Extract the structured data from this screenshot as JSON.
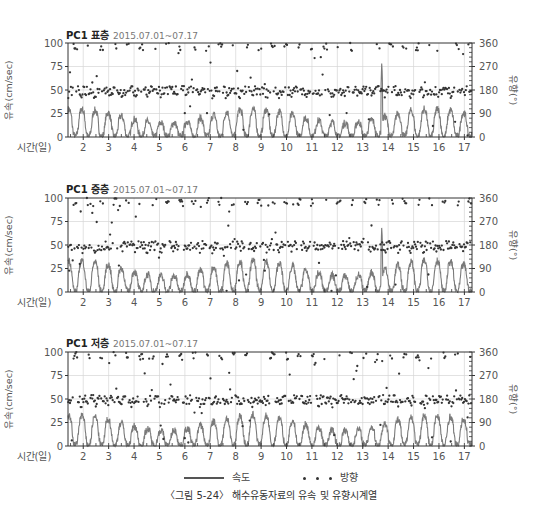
{
  "chart_data": [
    {
      "type": "line",
      "title": "PC1 표층",
      "subtitle": "2015.07.01~07.17",
      "xlabel": "시간(일)",
      "ylabel": "유속(cm/sec)",
      "y2label": "유향(°)",
      "x_ticks": [
        2,
        3,
        4,
        5,
        6,
        7,
        8,
        9,
        10,
        11,
        12,
        13,
        14,
        15,
        16,
        17
      ],
      "xlim": [
        1.4,
        17.3
      ],
      "ylim": [
        0,
        100
      ],
      "y_ticks": [
        0,
        25,
        50,
        75,
        100
      ],
      "y2lim": [
        0,
        360
      ],
      "y2_ticks": [
        0,
        90,
        180,
        270,
        360
      ],
      "grid": true,
      "series": [
        {
          "name": "속도",
          "kind": "line",
          "axis": "left",
          "color": "#7a7a7a",
          "pattern": "semidiurnal tidal speed, 0–35 cm/sec, peak spike ~80 near day 13.8",
          "amplitude": 30,
          "spike": {
            "x": 13.75,
            "y": 80
          }
        },
        {
          "name": "방향",
          "kind": "scatter",
          "axis": "right",
          "color": "#333333",
          "pattern": "direction clusters ~160–190°, scattered points near 340–360° and 0°"
        }
      ]
    },
    {
      "type": "line",
      "title": "PC1 중층",
      "subtitle": "2015.07.01~07.17",
      "xlabel": "시간(일)",
      "ylabel": "유속(cm/sec)",
      "y2label": "유향(°)",
      "x_ticks": [
        2,
        3,
        4,
        5,
        6,
        7,
        8,
        9,
        10,
        11,
        12,
        13,
        14,
        15,
        16,
        17
      ],
      "xlim": [
        1.4,
        17.3
      ],
      "ylim": [
        0,
        100
      ],
      "y_ticks": [
        0,
        25,
        50,
        75,
        100
      ],
      "y2lim": [
        0,
        360
      ],
      "y2_ticks": [
        0,
        90,
        180,
        270,
        360
      ],
      "grid": true,
      "series": [
        {
          "name": "속도",
          "kind": "line",
          "axis": "left",
          "color": "#7a7a7a",
          "pattern": "semidiurnal tidal speed, 0–40 cm/sec, spike ~70 near day 13.8",
          "amplitude": 34,
          "spike": {
            "x": 13.75,
            "y": 70
          }
        },
        {
          "name": "방향",
          "kind": "scatter",
          "axis": "right",
          "color": "#333333",
          "pattern": "direction clusters ~160–190°, scattered points near 340–360° and 0°"
        }
      ]
    },
    {
      "type": "line",
      "title": "PC1 저층",
      "subtitle": "2015.07.01~07.17",
      "xlabel": "시간(일)",
      "ylabel": "유속(cm/sec)",
      "y2label": "유향(°)",
      "x_ticks": [
        2,
        3,
        4,
        5,
        6,
        7,
        8,
        9,
        10,
        11,
        12,
        13,
        14,
        15,
        16,
        17
      ],
      "xlim": [
        1.4,
        17.3
      ],
      "ylim": [
        0,
        100
      ],
      "y_ticks": [
        0,
        25,
        50,
        75,
        100
      ],
      "y2lim": [
        0,
        360
      ],
      "y2_ticks": [
        0,
        90,
        180,
        270,
        360
      ],
      "grid": true,
      "series": [
        {
          "name": "속도",
          "kind": "line",
          "axis": "left",
          "color": "#7a7a7a",
          "pattern": "semidiurnal tidal speed, 0–40 cm/sec",
          "amplitude": 33,
          "spike": null
        },
        {
          "name": "방향",
          "kind": "scatter",
          "axis": "right",
          "color": "#333333",
          "pattern": "direction clusters ~160–190°, scattered points near 340–360° and 0°"
        }
      ]
    }
  ],
  "panels": [
    {
      "title": "PC1 표층",
      "date": "2015.07.01~07.17"
    },
    {
      "title": "PC1 중층",
      "date": "2015.07.01~07.17"
    },
    {
      "title": "PC1 저층",
      "date": "2015.07.01~07.17"
    }
  ],
  "axis": {
    "xlabel": "시간(일)",
    "ylabel": "유속(cm/sec)",
    "y2label": "유향(°)"
  },
  "legend": {
    "speed_label": "속도",
    "direction_label": "방향"
  },
  "caption": "〈그림 5-24〉 해수유동자료의 유속 및 유향시계열"
}
